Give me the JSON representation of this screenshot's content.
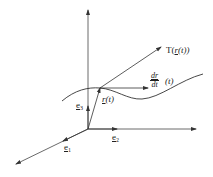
{
  "diagram": {
    "type": "space-curve-tangent",
    "axes": [
      {
        "name": "e1",
        "label": "e",
        "subscript": "1",
        "direction": "lower-left"
      },
      {
        "name": "e2",
        "label": "e",
        "subscript": "2",
        "direction": "right"
      },
      {
        "name": "e3",
        "label": "e",
        "subscript": "3",
        "direction": "up"
      }
    ],
    "labels": {
      "position_vector": "r(t)",
      "position_vector_r": "r",
      "position_vector_arg": "(t)",
      "tangent_line_prefix": "T(",
      "tangent_line_r": "r",
      "tangent_line_suffix": "(t))",
      "derivative_num": "dr",
      "derivative_den": "dt",
      "derivative_arg": "(t)"
    },
    "colors": {
      "line": "#333333",
      "text": "#222222",
      "background": "#ffffff"
    }
  }
}
